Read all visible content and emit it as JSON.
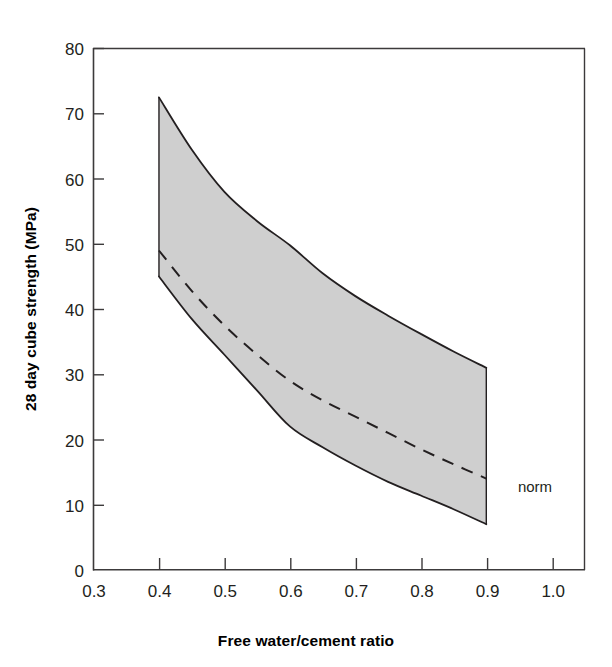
{
  "chart_data": {
    "type": "area",
    "title": "",
    "subtitle": "",
    "xlabel": "Free water/cement ratio",
    "ylabel": "28 day cube strength (MPa)",
    "xlim": [
      0.3,
      1.05
    ],
    "ylim": [
      0,
      80
    ],
    "xticks": [
      0.3,
      0.4,
      0.5,
      0.6,
      0.7,
      0.8,
      0.9,
      1.0
    ],
    "xtick_labels": [
      "0.3",
      "0.4",
      "0.5",
      "0.6",
      "0.7",
      "0.8",
      "0.9",
      "1.0"
    ],
    "yticks": [
      0,
      10,
      20,
      30,
      40,
      50,
      60,
      70,
      80
    ],
    "ytick_labels": [
      "0",
      "10",
      "20",
      "30",
      "40",
      "50",
      "60",
      "70",
      "80"
    ],
    "grid": false,
    "legend_position": "inline-annotation",
    "band_fill_color": "#cfcfcf",
    "line_color": "#231f20",
    "x": [
      0.4,
      0.45,
      0.5,
      0.55,
      0.6,
      0.65,
      0.7,
      0.75,
      0.8,
      0.85,
      0.9
    ],
    "series": [
      {
        "name": "upper bound",
        "style": "solid",
        "values": [
          72.5,
          64.5,
          58.0,
          53.5,
          49.8,
          45.5,
          42.0,
          39.0,
          36.2,
          33.5,
          31.0
        ]
      },
      {
        "name": "norm",
        "style": "dashed",
        "label": "norm",
        "values": [
          49.0,
          42.8,
          37.5,
          33.0,
          29.0,
          26.0,
          23.5,
          21.0,
          18.5,
          16.2,
          14.0
        ]
      },
      {
        "name": "lower bound",
        "style": "solid",
        "values": [
          45.0,
          38.5,
          33.0,
          27.5,
          22.0,
          18.8,
          16.0,
          13.5,
          11.4,
          9.3,
          7.0
        ]
      }
    ],
    "annotations": [
      {
        "text": "norm",
        "x": 0.93,
        "y": 14.0
      }
    ]
  }
}
